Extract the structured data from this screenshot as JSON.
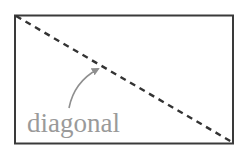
{
  "diagram": {
    "label": "diagonal",
    "colors": {
      "frame": "#3a3a3a",
      "diagonal": "#333333",
      "label": "#9a9a9a",
      "arrow": "#8f8f8f"
    },
    "shapes": {
      "rectangle": "frame",
      "diagonal_line": "dashed, top-left to bottom-right",
      "arrow": "curved, pointing from label to diagonal"
    }
  }
}
